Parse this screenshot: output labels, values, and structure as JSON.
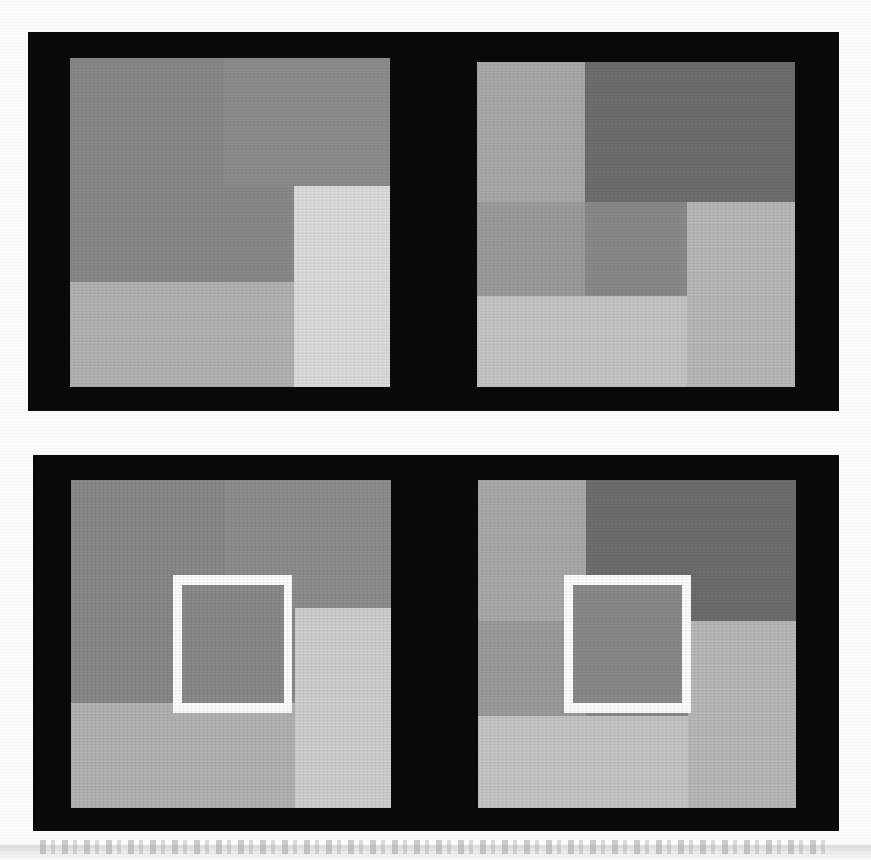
{
  "figure": {
    "kind": "lightness-contrast-illusion",
    "width": 871,
    "height": 860,
    "page_background": "#fbfbfb",
    "plate_background": "#0a0a0a",
    "isolation_frame_color": "#fdfdfd",
    "caption_text": ""
  },
  "chart_data": {
    "type": "heatmap",
    "title": "",
    "xlabel": "",
    "ylabel": "",
    "panels": [
      {
        "id": "top-left",
        "name": "top-left-stimulus",
        "row": "top",
        "column": "left",
        "has_isolation_frame": false,
        "frame": {
          "x": 70,
          "y": 58,
          "w": 320,
          "h": 329
        },
        "center_patch_value": "#8a8a8a",
        "patches": [
          {
            "name": "upper-left-large-gray",
            "x": 0,
            "y": 0,
            "w": 48,
            "h": 68,
            "color": "#888888"
          },
          {
            "name": "upper-right-gray",
            "x": 48,
            "y": 0,
            "w": 52,
            "h": 39,
            "color": "#8d8d8d"
          },
          {
            "name": "upper-mid-gray",
            "x": 48,
            "y": 39,
            "w": 22,
            "h": 29,
            "color": "#8f8f8f"
          },
          {
            "name": "center-test-patch",
            "x": 48,
            "y": 39,
            "w": 22,
            "h": 29,
            "color": "#8a8a8a"
          },
          {
            "name": "right-bright-column",
            "x": 70,
            "y": 39,
            "w": 30,
            "h": 61,
            "color": "#dcdcdc"
          },
          {
            "name": "lower-left-light-gray",
            "x": 0,
            "y": 68,
            "w": 70,
            "h": 32,
            "color": "#b2b2b2"
          }
        ]
      },
      {
        "id": "top-right",
        "name": "top-right-stimulus",
        "row": "top",
        "column": "right",
        "has_isolation_frame": false,
        "frame": {
          "x": 477,
          "y": 62,
          "w": 318,
          "h": 325
        },
        "center_patch_value": "#8a8a8a",
        "patches": [
          {
            "name": "upper-left-light-gray",
            "x": 0,
            "y": 0,
            "w": 34,
            "h": 43,
            "color": "#a9a9a9"
          },
          {
            "name": "upper-right-dark-gray",
            "x": 34,
            "y": 0,
            "w": 66,
            "h": 43,
            "color": "#6e6e6e"
          },
          {
            "name": "mid-left-gray",
            "x": 0,
            "y": 43,
            "w": 34,
            "h": 29,
            "color": "#9b9b9b"
          },
          {
            "name": "center-test-patch",
            "x": 34,
            "y": 43,
            "w": 32,
            "h": 29,
            "color": "#8a8a8a"
          },
          {
            "name": "right-light-column",
            "x": 66,
            "y": 43,
            "w": 34,
            "h": 57,
            "color": "#b8b8b8"
          },
          {
            "name": "lower-left-bright-gray",
            "x": 0,
            "y": 72,
            "w": 66,
            "h": 28,
            "color": "#c4c4c4"
          }
        ]
      },
      {
        "id": "bottom-left",
        "name": "bottom-left-stimulus",
        "row": "bottom",
        "column": "left",
        "has_isolation_frame": true,
        "frame": {
          "x": 71,
          "y": 480,
          "w": 320,
          "h": 328
        },
        "center_patch_value": "#8a8a8a",
        "isolation_frame": {
          "x": 32,
          "y": 29,
          "w": 37,
          "h": 42,
          "border": 7,
          "color": "#fdfdfd"
        },
        "patches": [
          {
            "name": "upper-left-large-gray",
            "x": 0,
            "y": 0,
            "w": 48,
            "h": 68,
            "color": "#888888"
          },
          {
            "name": "upper-right-gray",
            "x": 48,
            "y": 0,
            "w": 52,
            "h": 39,
            "color": "#8d8d8d"
          },
          {
            "name": "center-test-patch",
            "x": 48,
            "y": 39,
            "w": 22,
            "h": 29,
            "color": "#8a8a8a"
          },
          {
            "name": "right-bright-column",
            "x": 70,
            "y": 39,
            "w": 30,
            "h": 61,
            "color": "#cfcfcf"
          },
          {
            "name": "lower-left-light-gray",
            "x": 0,
            "y": 68,
            "w": 70,
            "h": 32,
            "color": "#b2b2b2"
          }
        ]
      },
      {
        "id": "bottom-right",
        "name": "bottom-right-stimulus",
        "row": "bottom",
        "column": "right",
        "has_isolation_frame": true,
        "frame": {
          "x": 478,
          "y": 480,
          "w": 318,
          "h": 328
        },
        "center_patch_value": "#8a8a8a",
        "isolation_frame": {
          "x": 27,
          "y": 29,
          "w": 40,
          "h": 42,
          "border": 7,
          "color": "#fdfdfd"
        },
        "patches": [
          {
            "name": "upper-left-light-gray",
            "x": 0,
            "y": 0,
            "w": 34,
            "h": 43,
            "color": "#a9a9a9"
          },
          {
            "name": "upper-right-dark-gray",
            "x": 34,
            "y": 0,
            "w": 66,
            "h": 43,
            "color": "#6e6e6e"
          },
          {
            "name": "mid-left-gray",
            "x": 0,
            "y": 43,
            "w": 34,
            "h": 29,
            "color": "#9b9b9b"
          },
          {
            "name": "center-test-patch",
            "x": 34,
            "y": 43,
            "w": 32,
            "h": 29,
            "color": "#8a8a8a"
          },
          {
            "name": "right-light-column",
            "x": 66,
            "y": 43,
            "w": 34,
            "h": 57,
            "color": "#b8b8b8"
          },
          {
            "name": "lower-left-bright-gray",
            "x": 0,
            "y": 72,
            "w": 66,
            "h": 28,
            "color": "#c4c4c4"
          }
        ]
      }
    ]
  }
}
